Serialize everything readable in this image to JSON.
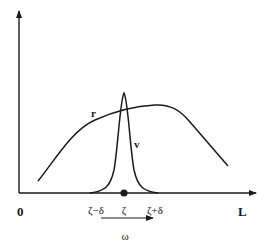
{
  "diagram": {
    "axes": {
      "origin_label": "0",
      "x_end_label": "L"
    },
    "curves": {
      "r_label": "r",
      "v_label": "v"
    },
    "ticks": {
      "left": "ζ−δ",
      "center": "ζ",
      "right": "ζ+δ"
    },
    "interval": {
      "label": "ω"
    },
    "colors": {
      "stroke": "#1a1a1a",
      "background": "#ffffff"
    }
  }
}
